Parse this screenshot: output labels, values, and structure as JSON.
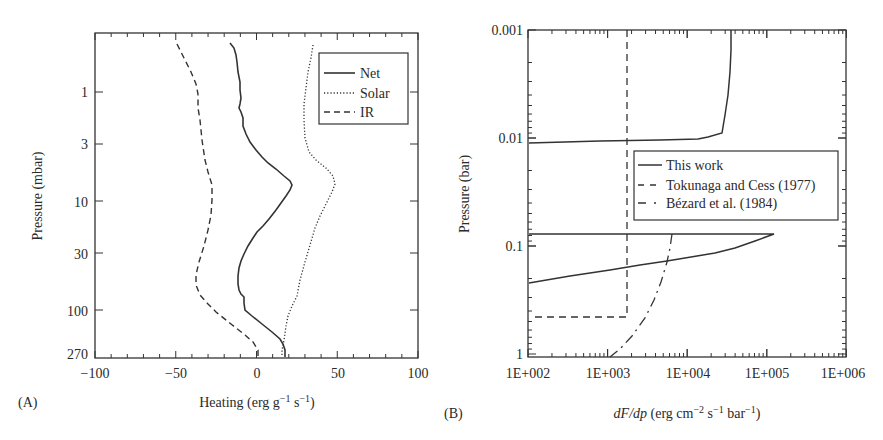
{
  "chart_data": [
    {
      "panel": "(A)",
      "type": "line",
      "title": "",
      "xlabel": "Heating (erg g⁻¹ s⁻¹)",
      "ylabel": "Pressure (mbar)",
      "xlim": [
        -100,
        100
      ],
      "ylim": [
        270,
        0.3
      ],
      "yscale": "log",
      "xticks": [
        "-100",
        "-50",
        "0",
        "50",
        "100"
      ],
      "yticks": [
        "1",
        "3",
        "10",
        "30",
        "100",
        "270"
      ],
      "legend_position": "upper right",
      "grid": false,
      "series": [
        {
          "name": "Net",
          "style": "solid",
          "x": [
            -17,
            -13,
            -12,
            -10.5,
            -9,
            -10.5,
            -8.5,
            -8.5,
            -5.5,
            -0.5,
            7,
            15,
            22,
            18.5,
            13,
            5.5,
            -1,
            -5.5,
            -10.5,
            -12,
            -11,
            -8.5,
            -8,
            3,
            14,
            16.5,
            17
          ],
          "p": [
            0.36,
            0.46,
            0.63,
            0.92,
            1.2,
            1.4,
            1.6,
            2.0,
            2.5,
            3.4,
            4.5,
            5.8,
            7.1,
            8.8,
            11.6,
            15.6,
            19,
            25,
            36,
            48,
            65,
            76,
            100,
            143,
            190,
            223,
            275
          ]
        },
        {
          "name": "Solar",
          "style": "dotted",
          "x": [
            35,
            33,
            31,
            29.5,
            29,
            29.5,
            30,
            32,
            37,
            44,
            48,
            46,
            42,
            37,
            33,
            29,
            25,
            22,
            18,
            15,
            14.5
          ],
          "p": [
            0.36,
            0.5,
            0.75,
            1.1,
            1.6,
            2.3,
            3.2,
            4.0,
            5.0,
            6.0,
            7.1,
            9.0,
            12,
            16,
            22,
            32,
            50,
            75,
            110,
            190,
            275
          ]
        },
        {
          "name": "IR",
          "style": "dashed",
          "x": [
            -50,
            -45,
            -41,
            -38,
            -37,
            -36,
            -33,
            -29,
            -27,
            -28,
            -30,
            -33,
            -37,
            -38,
            -36,
            -30,
            -20,
            -8,
            0,
            1
          ],
          "p": [
            0.36,
            0.6,
            0.9,
            1.2,
            1.8,
            3.0,
            4.5,
            6.0,
            7.5,
            12,
            20,
            30,
            45,
            60,
            75,
            100,
            140,
            190,
            240,
            275
          ]
        }
      ]
    },
    {
      "panel": "(B)",
      "type": "line",
      "title": "",
      "xlabel": "dF/dp (erg cm⁻² s⁻¹ bar⁻¹)",
      "ylabel": "Pressure (bar)",
      "xscale": "log",
      "yscale": "log",
      "xlim": [
        100,
        1000000
      ],
      "ylim": [
        1,
        0.001
      ],
      "xticks": [
        "1E+002",
        "1E+003",
        "1E+004",
        "1E+005",
        "1E+006"
      ],
      "yticks": [
        "0.001",
        "0.01",
        "0.1",
        "1"
      ],
      "legend_position": "center right",
      "grid": false,
      "series": [
        {
          "name": "This work",
          "style": "solid",
          "x": [
            35000,
            34000,
            32000,
            29000,
            27000,
            15000,
            7000,
            100,
            100,
            130000,
            15000,
            6000,
            2000,
            100
          ],
          "p": [
            0.001,
            0.002,
            0.004,
            0.007,
            0.0088,
            0.0101,
            0.0105,
            0.011,
            0.076,
            0.076,
            0.12,
            0.13,
            0.15,
            0.21
          ]
        },
        {
          "name": "Tokunaga and Cess (1977)",
          "style": "dashed",
          "x": [
            1750,
            1750,
            100
          ],
          "p": [
            0.001,
            0.45,
            0.45
          ]
        },
        {
          "name": "Bézard et al. (1984)",
          "style": "dash-dot",
          "x": [
            6500,
            6200,
            5500,
            4200,
            2800,
            1100
          ],
          "p": [
            0.076,
            0.1,
            0.15,
            0.25,
            0.45,
            1.0
          ]
        }
      ]
    }
  ],
  "panelA": {
    "tag": "(A)",
    "ylabel": "Pressure (mbar)",
    "xlabel_main": "Heating (erg g",
    "xlabel_sup1": "−1",
    "xlabel_mid": " s",
    "xlabel_sup2": "−1",
    "xlabel_end": ")",
    "xticks": [
      "−100",
      "−50",
      "0",
      "50",
      "100"
    ],
    "yticks": [
      "1",
      "3",
      "10",
      "30",
      "100",
      "270"
    ],
    "legend": [
      "Net",
      "Solar",
      "IR"
    ]
  },
  "panelB": {
    "tag": "(B)",
    "ylabel": "Pressure (bar)",
    "xlabel_italic": "dF/dp",
    "xlabel_rest1": " (erg cm",
    "xlabel_sup1": "−2",
    "xlabel_rest2": " s",
    "xlabel_sup2": "−1",
    "xlabel_rest3": " bar",
    "xlabel_sup3": "−1",
    "xlabel_end": ")",
    "xticks": [
      "1E+002",
      "1E+003",
      "1E+004",
      "1E+005",
      "1E+006"
    ],
    "yticks": [
      "0.001",
      "0.01",
      "0.1",
      "1"
    ],
    "legend": [
      "This work",
      "Tokunaga and Cess (1977)",
      "Bézard et al. (1984)"
    ]
  }
}
